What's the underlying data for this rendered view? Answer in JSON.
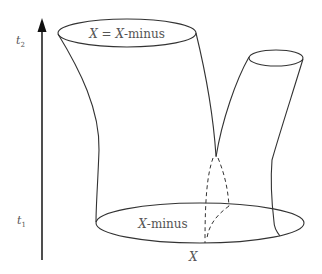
{
  "diagram": {
    "time_axis": {
      "top_label_base": "t",
      "top_label_sub": "2",
      "bottom_label_base": "t",
      "bottom_label_sub": "1"
    },
    "top_ellipse_label": {
      "var1": "X",
      "eq": " = ",
      "var2": "X",
      "suffix": "-minus"
    },
    "bottom_ellipse_label": {
      "var": "X",
      "suffix": "-minus"
    },
    "bottom_point_label": "X",
    "colors": {
      "stroke": "#333333",
      "text": "#555555",
      "background": "#ffffff"
    }
  }
}
